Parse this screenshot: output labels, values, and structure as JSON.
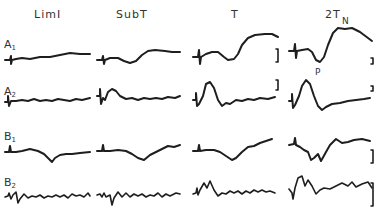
{
  "figure": {
    "columns": [
      {
        "label": "LimI",
        "x": 34
      },
      {
        "label": "SubT",
        "x": 116
      },
      {
        "label": "T",
        "x": 231
      },
      {
        "label": "2T",
        "x": 325
      }
    ],
    "rows": [
      {
        "letter": "A",
        "sub": "1",
        "y": 38
      },
      {
        "letter": "A",
        "sub": "2",
        "y": 85
      },
      {
        "letter": "B",
        "sub": "1",
        "y": 130
      },
      {
        "letter": "B",
        "sub": "2",
        "y": 176
      }
    ],
    "peak_labels": [
      {
        "text": "P",
        "x": 315,
        "y": 67
      },
      {
        "text": "N",
        "x": 342,
        "y": 16
      }
    ]
  },
  "chart_data": {
    "type": "line",
    "title": "",
    "column_labels": [
      "LimI",
      "SubT",
      "T",
      "2T"
    ],
    "row_labels": [
      "A1",
      "A2",
      "B1",
      "B2"
    ],
    "annotations": [
      "P",
      "N"
    ],
    "scale_bars": "vertical calibration bars at right of T and 2T columns",
    "traces": [
      {
        "row": "A1",
        "col": "LimI",
        "points": "5,60 10,60 11,56 11,64 12,60 16,59 22,58 30,59 40,57 50,57 60,55 70,53 80,54 90,54"
      },
      {
        "row": "A1",
        "col": "SubT",
        "points": "97,60 102,60 103,56 104,64 105,60 110,58 118,58 124,61 130,63 136,61 142,55 148,51 155,50 165,51 172,52 180,52"
      },
      {
        "row": "A1",
        "col": "T",
        "points": "193,57 198,57 199,50 200,64 201,57 206,54 212,52 218,52 224,57 228,60 234,59 238,54 242,45 248,38 255,35 265,34 272,34 278,37"
      },
      {
        "row": "A1",
        "col": "2T",
        "points": "289,51 294,51 295,44 296,58 297,51 302,50 308,49 312,52 316,60 320,62 324,57 328,45 333,33 338,28 345,29 352,28 360,32 368,38 372,41"
      },
      {
        "row": "A2",
        "col": "LimI",
        "points": "5,102 8,102 8,96 9,106 11,101 16,101 22,100 28,101 34,99 40,101 46,100 52,101 58,99 64,100 70,101 76,99 82,100 90,98"
      },
      {
        "row": "A2",
        "col": "SubT",
        "points": "97,96 100,96 100,89 101,104 103,98 105,100 108,92 112,89 116,91 120,96 126,99 132,98 138,100 144,98 150,99 156,98 162,99 168,97 175,98 180,96"
      },
      {
        "row": "A2",
        "col": "T",
        "points": "193,100 196,100 196,93 197,106 199,104 203,96 206,84 210,82 214,88 218,100 222,106 226,103 230,104 236,100 242,101 248,99 254,100 260,98 268,99 275,97"
      },
      {
        "row": "A2",
        "col": "2T",
        "points": "289,101 292,101 292,94 293,108 295,105 299,96 302,86 306,80 310,84 314,96 318,106 322,110 326,107 332,104 340,103 348,101 356,100 364,99 370,98"
      },
      {
        "row": "B1",
        "col": "LimI",
        "points": "5,152 9,152 10,146 11,152 16,152 22,151 30,149 38,151 44,154 48,158 52,162 55,158 60,155 66,154 72,154 80,153 90,152"
      },
      {
        "row": "B1",
        "col": "SubT",
        "points": "97,151 102,151 103,145 104,151 110,151 118,150 126,151 132,154 138,158 144,160 150,155 156,152 162,149 168,146 174,147 180,145"
      },
      {
        "row": "B1",
        "col": "T",
        "points": "193,151 198,151 199,145 200,151 206,150 214,150 220,152 226,156 232,160 236,158 242,152 248,147 254,146 260,143 266,141 272,139"
      },
      {
        "row": "B1",
        "col": "2T",
        "points": "289,145 294,144 295,138 296,145 300,147 304,150 308,152 311,160 314,158 318,154 321,161 326,152 330,145 336,139 342,143 348,142 354,140 362,139 370,141"
      },
      {
        "row": "B2",
        "col": "LimI",
        "points": "5,197 8,196 9,193 11,199 13,195 16,192 18,203 20,199 24,194 28,198 32,196 36,197 40,195 44,198 48,196 52,197 56,195 60,197 64,195 68,198 72,194 76,196 80,195 84,197 88,193 90,196"
      },
      {
        "row": "B2",
        "col": "SubT",
        "points": "97,195 100,194 102,197 104,193 106,197 110,195 112,205 114,198 118,192 122,197 126,193 130,197 134,194 138,196 142,194 146,197 150,195 154,196 158,193 162,197 166,194 170,196 176,193 180,194"
      },
      {
        "row": "B2",
        "col": "T",
        "points": "193,194 196,193 197,188 198,195 200,190 204,183 207,188 210,181 214,190 218,196 222,193 226,194 230,191 234,193 238,191 242,194 246,191 250,193 254,190 258,192 262,190 266,192 270,191 275,193"
      },
      {
        "row": "B2",
        "col": "2T",
        "points": "289,189 292,193 293,199 295,188 298,178 302,176 305,186 308,180 312,186 316,194 320,190 324,188 330,189 336,186 342,183 348,186 352,182 356,187 362,184 368,182 372,188"
      }
    ],
    "scale_bar_positions": [
      {
        "x": 278,
        "y1": 49,
        "y2": 62
      },
      {
        "x": 278,
        "y1": 80,
        "y2": 90
      },
      {
        "x": 373,
        "y1": 58,
        "y2": 64
      },
      {
        "x": 373,
        "y1": 86,
        "y2": 91
      },
      {
        "x": 373,
        "y1": 150,
        "y2": 163
      },
      {
        "x": 373,
        "y1": 183,
        "y2": 206
      }
    ]
  }
}
